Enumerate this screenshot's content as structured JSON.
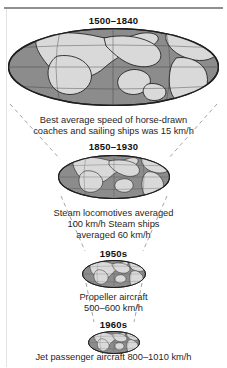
{
  "figure": {
    "title_rule": "horizontal-rule",
    "background_color": "#ffffff",
    "land_color": "#d9d9d9",
    "ocean_color": "#8c8c8c",
    "outline_color": "#2b2b2b",
    "funnel_line_color": "#9a9a9a"
  },
  "stages": [
    {
      "era": "1500–1840",
      "caption_lines": [
        "Best average speed of horse-drawn",
        "coaches and sailing ships was 15 km/h"
      ],
      "speed": "15 km/h",
      "globe_name": "globe-1500-1840"
    },
    {
      "era": "1850–1930",
      "caption_lines": [
        "Steam locomotives averaged",
        "100 km/h Steam ships",
        "averaged 60 km/h"
      ],
      "speed": "100 km/h",
      "globe_name": "globe-1850-1930"
    },
    {
      "era": "1950s",
      "caption_lines": [
        "Propeller aircraft",
        "500–600 km/h"
      ],
      "speed": "500–600 km/h",
      "globe_name": "globe-1950s"
    },
    {
      "era": "1960s",
      "caption_lines": [
        "Jet passenger aircraft 800–1010 km/h"
      ],
      "speed": "800–1010 km/h",
      "globe_name": "globe-1960s"
    }
  ]
}
